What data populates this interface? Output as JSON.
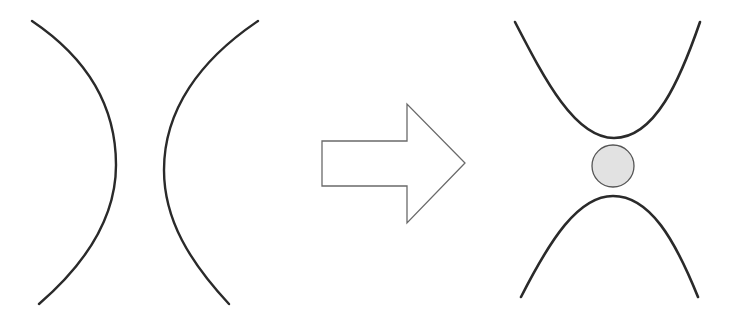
{
  "diagram": {
    "type": "before-after transformation",
    "colors": {
      "background": "#ffffff",
      "curve_stroke": "#2a2a2a",
      "arrow_stroke": "#6a6a6a",
      "arrow_fill": "#ffffff",
      "particle_fill": "#e2e2e2",
      "particle_stroke": "#555555"
    },
    "left_panel": {
      "description": "Two opposing curved walls bowing toward each other (open channel)",
      "curves": [
        "left-curve",
        "right-curve"
      ]
    },
    "arrow": {
      "direction": "right",
      "label": ""
    },
    "right_panel": {
      "description": "Two curves forming a narrow constriction with a trapped circular particle between them",
      "curves": [
        "top-curve",
        "bottom-curve"
      ],
      "particle": "circle"
    }
  }
}
